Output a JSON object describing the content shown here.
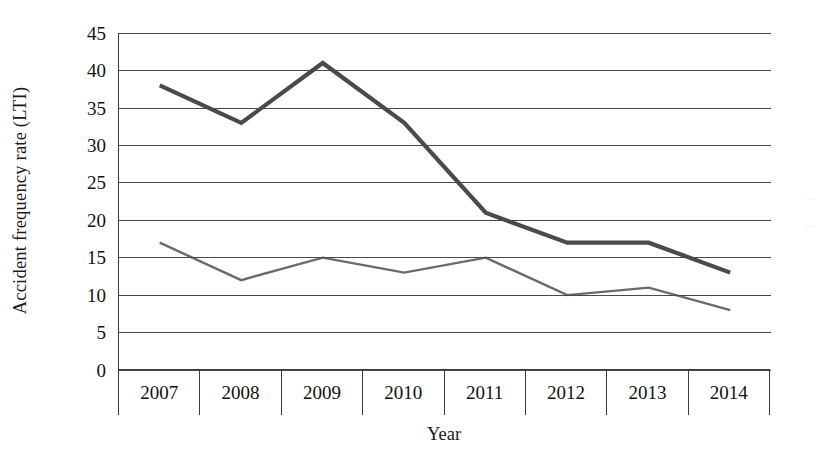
{
  "chart_data": {
    "type": "line",
    "title": "",
    "xlabel": "Year",
    "ylabel": "Accident frequency rate (LTI)",
    "categories": [
      "2007",
      "2008",
      "2009",
      "2010",
      "2011",
      "2012",
      "2013",
      "2014"
    ],
    "series": [
      {
        "name": "upper-series",
        "values": [
          38,
          33,
          41,
          33,
          21,
          17,
          17,
          13
        ],
        "color": "#4a4a4a",
        "width": 4.2
      },
      {
        "name": "lower-series",
        "values": [
          17,
          12,
          15,
          13,
          15,
          10,
          11,
          8
        ],
        "color": "#6a6a6a",
        "width": 2.4
      }
    ],
    "ylim": [
      0,
      45
    ],
    "ytick_values": [
      45,
      40,
      35,
      30,
      25,
      20,
      15,
      10,
      5,
      0
    ],
    "ytick_labels": [
      "45",
      "40",
      "35",
      "30",
      "25",
      "20",
      "15",
      "10",
      "5",
      "0"
    ],
    "grid": true,
    "legend": "none"
  },
  "axes": {
    "y_title": "Accident frequency rate (LTI)",
    "x_title": "Year"
  }
}
